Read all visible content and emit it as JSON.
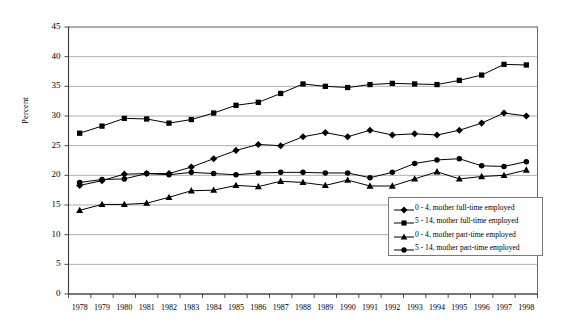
{
  "chart_data": {
    "type": "line",
    "title": "",
    "xlabel": "",
    "ylabel": "Percent",
    "ylim": [
      0,
      45
    ],
    "ytick_step": 5,
    "yticks": [
      "0",
      "5",
      "10",
      "15",
      "20",
      "25",
      "30",
      "35",
      "40",
      "45"
    ],
    "grid": true,
    "grid_axis": "y",
    "legend_position": "inside-lower-right",
    "categories": [
      "1978",
      "1979",
      "1980",
      "1981",
      "1982",
      "1983",
      "1984",
      "1985",
      "1986",
      "1987",
      "1988",
      "1989",
      "1990",
      "1991",
      "1992",
      "1993",
      "1994",
      "1995",
      "1996",
      "1997",
      "1998"
    ],
    "series": [
      {
        "name": "0 - 4, mother full-time employed",
        "marker": "diamond",
        "color": "#000000",
        "values": [
          18.3,
          19.1,
          20.2,
          20.3,
          20.3,
          21.4,
          22.8,
          24.2,
          25.2,
          25.0,
          26.5,
          27.2,
          26.5,
          27.6,
          26.8,
          27.0,
          26.8,
          27.6,
          28.8,
          30.5,
          30.0
        ]
      },
      {
        "name": "5 - 14, mother full-time employed",
        "marker": "square",
        "color": "#000000",
        "values": [
          27.1,
          28.3,
          29.6,
          29.5,
          28.8,
          29.4,
          30.5,
          31.8,
          32.3,
          33.8,
          35.4,
          35.0,
          34.8,
          35.3,
          35.5,
          35.4,
          35.3,
          36.0,
          36.9,
          38.7,
          38.6
        ]
      },
      {
        "name": "0 - 4, mother part-time employed",
        "marker": "triangle",
        "color": "#000000",
        "values": [
          14.1,
          15.1,
          15.1,
          15.3,
          16.3,
          17.4,
          17.5,
          18.3,
          18.1,
          19.0,
          18.8,
          18.3,
          19.2,
          18.2,
          18.2,
          19.4,
          20.6,
          19.4,
          19.8,
          20.0,
          20.9
        ]
      },
      {
        "name": "5 - 14, mother part-time employed",
        "marker": "circle",
        "color": "#000000",
        "values": [
          18.8,
          19.3,
          19.4,
          20.3,
          20.1,
          20.5,
          20.3,
          20.1,
          20.4,
          20.5,
          20.5,
          20.4,
          20.4,
          19.6,
          20.5,
          22.0,
          22.6,
          22.8,
          21.6,
          21.5,
          22.3
        ]
      }
    ]
  }
}
